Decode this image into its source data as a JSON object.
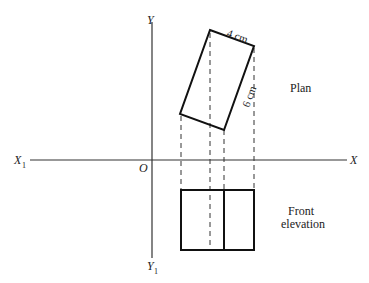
{
  "axes": {
    "x_label": "X",
    "x1_label": "X",
    "x1_sub": "1",
    "y_label": "Y",
    "y1_label": "Y",
    "y1_sub": "1",
    "origin_label": "O"
  },
  "plan": {
    "title": "Plan",
    "width_label": "4 cm",
    "length_label": "6 cm"
  },
  "elevation": {
    "title_line1": "Front",
    "title_line2": "elevation"
  }
}
